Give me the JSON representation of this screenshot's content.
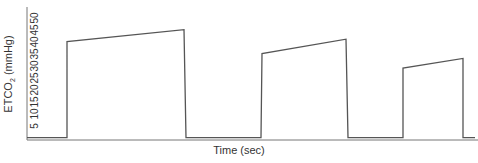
{
  "chart_data": {
    "type": "line",
    "title": "",
    "xlabel": "Time (sec)",
    "ylabel": "ETCO2 (mmHg)",
    "ylabel_main": "ETCO",
    "ylabel_sub": "2",
    "ylabel_units": " (mmHg)",
    "yticks": [
      5,
      10,
      15,
      20,
      25,
      30,
      35,
      40,
      45,
      50
    ],
    "ylim": [
      0,
      50
    ],
    "xticks": [],
    "grid": false,
    "legend": null,
    "series": [
      {
        "name": "ETCO2",
        "x": [
          0,
          40,
          40,
          157,
          159,
          234,
          235,
          319,
          321,
          376,
          376,
          436,
          436,
          448
        ],
        "y": [
          1,
          1,
          41,
          46,
          1,
          1,
          36,
          42,
          1,
          1,
          30,
          34,
          1,
          1
        ]
      }
    ],
    "plateaus": [
      {
        "start_value": 41,
        "end_value": 46
      },
      {
        "start_value": 36,
        "end_value": 42
      },
      {
        "start_value": 30,
        "end_value": 34
      }
    ],
    "line_color": "#555555"
  }
}
